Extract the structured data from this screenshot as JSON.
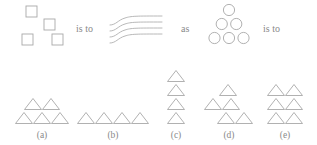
{
  "puzzle": {
    "type": "visual-analogy",
    "connectors": [
      {
        "id": "is-to-1",
        "text": "is to",
        "x": 76,
        "y": 24
      },
      {
        "id": "as",
        "text": "as",
        "x": 181,
        "y": 24
      },
      {
        "id": "is-to-2",
        "text": "is to",
        "x": 263,
        "y": 24
      }
    ],
    "stimulus": {
      "term_a": {
        "name": "scattered-squares",
        "shape": "square",
        "count": 4,
        "arrangement": "scattered",
        "size": 11,
        "positions": [
          {
            "x": 26,
            "y": 6
          },
          {
            "x": 44,
            "y": 19
          },
          {
            "x": 22,
            "y": 34
          },
          {
            "x": 52,
            "y": 34
          }
        ]
      },
      "term_b": {
        "name": "wavy-lines",
        "shape": "wavy-line",
        "count": 4,
        "arrangement": "stacked-parallel-curves",
        "line_spacing": 6,
        "origin": {
          "x": 110,
          "y": 16
        }
      },
      "term_c": {
        "name": "circle-triangle-stack",
        "shape": "circle",
        "count": 6,
        "arrangement": "triangular-1-2-3",
        "radius": 5.6,
        "rows": [
          {
            "count": 1,
            "cx": 229,
            "cy": 10
          },
          {
            "count": 2,
            "cx": 229,
            "cy": 24
          },
          {
            "count": 3,
            "cx": 229,
            "cy": 38
          }
        ],
        "h_gap": 14.5
      },
      "term_d": {
        "name": "missing-term",
        "text": "?"
      }
    },
    "options": [
      {
        "id": "a",
        "label": "(a)",
        "shape": "triangle",
        "count": 5,
        "arrangement": "2-over-3",
        "label_x": 42,
        "label_y": 131,
        "rows": [
          {
            "count": 2,
            "cx": 42,
            "cy": 104
          },
          {
            "count": 3,
            "cx": 42,
            "cy": 118
          }
        ]
      },
      {
        "id": "b",
        "label": "(b)",
        "shape": "triangle",
        "count": 4,
        "arrangement": "single-row",
        "label_x": 113,
        "label_y": 131,
        "rows": [
          {
            "count": 4,
            "cx": 113,
            "cy": 118
          }
        ]
      },
      {
        "id": "c",
        "label": "(c)",
        "shape": "triangle",
        "count": 4,
        "arrangement": "single-column",
        "label_x": 176,
        "label_y": 131,
        "rows": [
          {
            "count": 1,
            "cx": 176,
            "cy": 76
          },
          {
            "count": 1,
            "cx": 176,
            "cy": 90
          },
          {
            "count": 1,
            "cx": 176,
            "cy": 104
          },
          {
            "count": 1,
            "cx": 176,
            "cy": 118
          }
        ]
      },
      {
        "id": "d",
        "label": "(d)",
        "shape": "triangle",
        "count": 5,
        "arrangement": "1-2-2-offset",
        "label_x": 229,
        "label_y": 131,
        "rows": [
          {
            "count": 1,
            "cx": 228,
            "cy": 90
          },
          {
            "count": 2,
            "cx": 222,
            "cy": 104
          },
          {
            "count": 2,
            "cx": 235,
            "cy": 118
          }
        ]
      },
      {
        "id": "e",
        "label": "(e)",
        "shape": "triangle",
        "count": 6,
        "arrangement": "grid-2-by-3",
        "label_x": 285,
        "label_y": 131,
        "rows": [
          {
            "count": 2,
            "cx": 285,
            "cy": 90
          },
          {
            "count": 2,
            "cx": 285,
            "cy": 104
          },
          {
            "count": 2,
            "cx": 285,
            "cy": 118
          }
        ]
      }
    ],
    "geometry": {
      "triangle_width": 17,
      "triangle_height": 11,
      "triangle_h_gap": 18,
      "square_size": 11
    },
    "colors": {
      "background": "#ffffff",
      "shape_stroke": "#a8a8a8",
      "text": "#8a8a8a"
    }
  }
}
